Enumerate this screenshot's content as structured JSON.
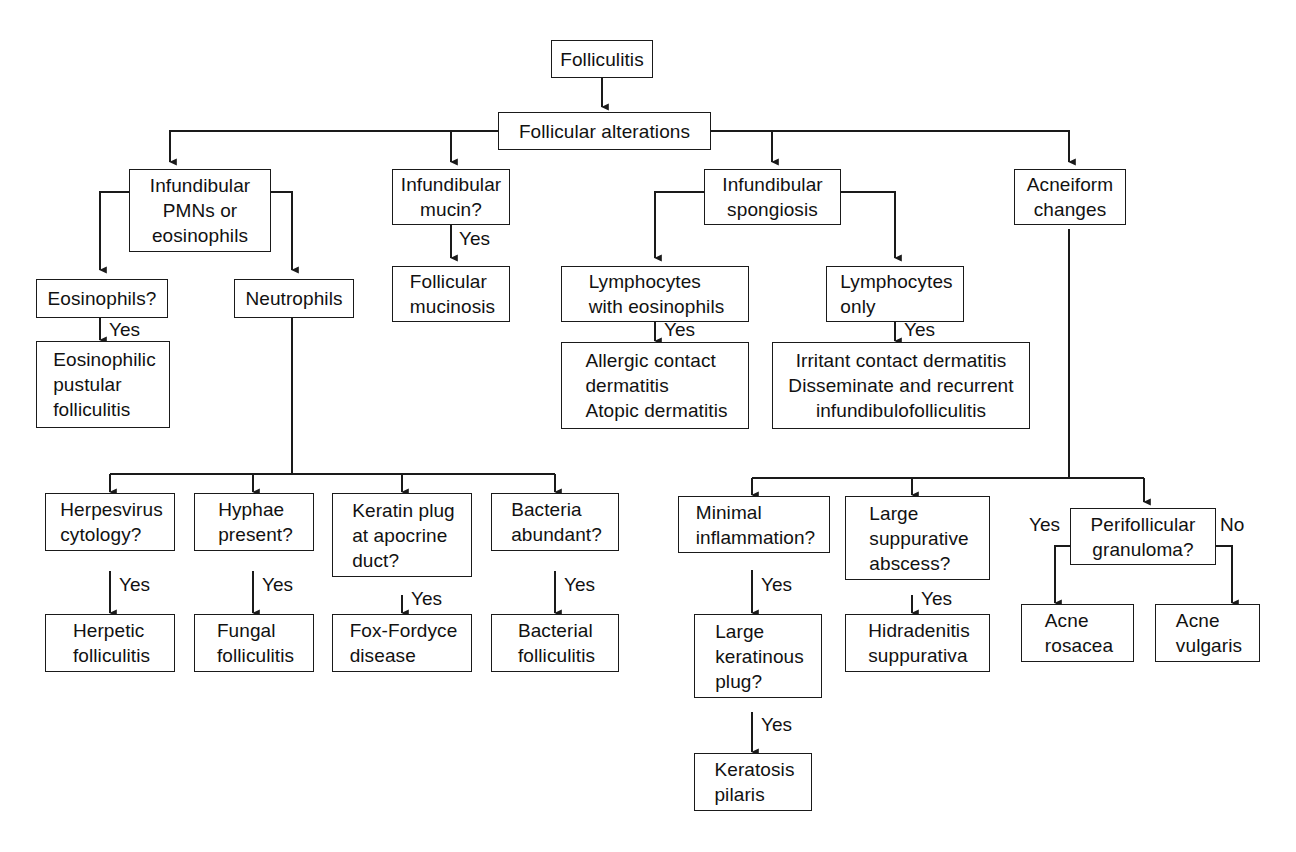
{
  "diagram": {
    "line_color": "#1a1a1a",
    "text_color": "#111111",
    "background": "#ffffff"
  },
  "nodes": {
    "folliculitis": "Folliculitis",
    "follicular_alterations": "Follicular alterations",
    "infundibular_pmns": "Infundibular\nPMNs or\neosinophils",
    "infundibular_mucin": "Infundibular\nmucin?",
    "infundibular_spongiosis": "Infundibular\nspongiosis",
    "acneiform_changes": "Acneiform\nchanges",
    "eosinophils_q": "Eosinophils?",
    "neutrophils": "Neutrophils",
    "follicular_mucinosis": "Follicular\nmucinosis",
    "lymphocytes_with_eos": "Lymphocytes\nwith eosinophils",
    "lymphocytes_only": "Lymphocytes\nonly",
    "eosinophilic_pustular_folliculitis": "Eosinophilic\npustular\nfolliculitis",
    "allergic_contact": "Allergic contact\ndermatitis\nAtopic dermatitis",
    "irritant_contact": "Irritant contact dermatitis\nDisseminate and recurrent\ninfundibulofolliculitis",
    "herpesvirus_cytology_q": "Herpesvirus\ncytology?",
    "hyphae_present_q": "Hyphae\npresent?",
    "keratin_plug_q": "Keratin plug\nat apocrine\nduct?",
    "bacteria_abundant_q": "Bacteria\nabundant?",
    "minimal_inflammation_q": "Minimal\ninflammation?",
    "large_suppurative_q": "Large\nsuppurative\nabscess?",
    "perifollicular_granuloma_q": "Perifollicular\ngranuloma?",
    "herpetic_folliculitis": "Herpetic\nfolliculitis",
    "fungal_folliculitis": "Fungal\nfolliculitis",
    "fox_fordyce": "Fox-Fordyce\ndisease",
    "bacterial_folliculitis": "Bacterial\nfolliculitis",
    "large_keratinous_plug_q": "Large\nkeratinous\nplug?",
    "hidradenitis": "Hidradenitis\nsuppurativa",
    "acne_rosacea": "Acne\nrosacea",
    "acne_vulgaris": "Acne\nvulgaris",
    "keratosis_pilaris": "Keratosis\npilaris"
  },
  "edge_labels": {
    "mucin_yes": "Yes",
    "eosinophils_yes": "Yes",
    "lymph_eos_yes": "Yes",
    "lymph_only_yes": "Yes",
    "herpes_yes": "Yes",
    "hyphae_yes": "Yes",
    "keratin_yes": "Yes",
    "bacteria_yes": "Yes",
    "minimal_yes": "Yes",
    "suppurative_yes": "Yes",
    "keratinous_yes": "Yes",
    "granuloma_yes": "Yes",
    "granuloma_no": "No"
  }
}
